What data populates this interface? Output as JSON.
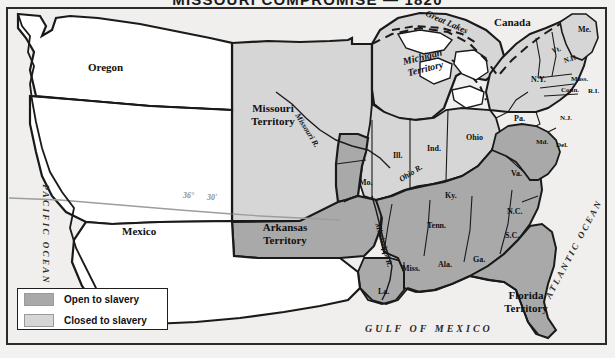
{
  "map": {
    "title": "MISSOURI COMPROMISE — 1820",
    "colors": {
      "open_to_slavery": "#a9a9a9",
      "closed_to_slavery": "#d6d6d6",
      "unorganized": "#ffffff",
      "ocean": "#f0efed",
      "border": "#1a1a1a",
      "latitude_line": "#9d9d9d"
    }
  },
  "legend": {
    "items": [
      {
        "label": "Open to slavery",
        "swatch": "#a9a9a9"
      },
      {
        "label": "Closed to slavery",
        "swatch": "#d6d6d6"
      }
    ]
  },
  "labels": {
    "oceans": [
      {
        "name": "pacific-ocean",
        "text": "PACIFIC OCEAN"
      },
      {
        "name": "atlantic-ocean",
        "text": "ATLANTIC OCEAN"
      },
      {
        "name": "gulf-of-mexico",
        "text": "GULF OF MEXICO"
      }
    ],
    "countries": [
      {
        "name": "canada",
        "text": "Canada"
      },
      {
        "name": "mexico",
        "text": "Mexico"
      }
    ],
    "regions": [
      {
        "name": "oregon",
        "text": "Oregon"
      }
    ],
    "territories": [
      {
        "name": "missouri-territory",
        "line1": "Missouri",
        "line2": "Territory"
      },
      {
        "name": "michigan-territory",
        "line1": "Michigan",
        "line2": "Territory"
      },
      {
        "name": "arkansas-territory",
        "line1": "Arkansas",
        "line2": "Territory"
      },
      {
        "name": "florida-territory",
        "line1": "Florida",
        "line2": "Territory"
      }
    ],
    "states": [
      {
        "name": "maine",
        "text": "Me."
      },
      {
        "name": "vermont",
        "text": "Vt."
      },
      {
        "name": "new-hampshire",
        "text": "N.H."
      },
      {
        "name": "massachusetts",
        "text": "Mass."
      },
      {
        "name": "connecticut",
        "text": "Conn."
      },
      {
        "name": "rhode-island",
        "text": "R.I."
      },
      {
        "name": "new-york",
        "text": "N.Y."
      },
      {
        "name": "pennsylvania",
        "text": "Pa."
      },
      {
        "name": "new-jersey",
        "text": "N.J."
      },
      {
        "name": "delaware",
        "text": "Del."
      },
      {
        "name": "maryland",
        "text": "Md."
      },
      {
        "name": "virginia",
        "text": "Va."
      },
      {
        "name": "north-carolina",
        "text": "N.C."
      },
      {
        "name": "south-carolina",
        "text": "S.C."
      },
      {
        "name": "georgia",
        "text": "Ga."
      },
      {
        "name": "alabama",
        "text": "Ala."
      },
      {
        "name": "mississippi",
        "text": "Miss."
      },
      {
        "name": "louisiana",
        "text": "La."
      },
      {
        "name": "tennessee",
        "text": "Tenn."
      },
      {
        "name": "kentucky",
        "text": "Ky."
      },
      {
        "name": "ohio",
        "text": "Ohio"
      },
      {
        "name": "indiana",
        "text": "Ind."
      },
      {
        "name": "illinois",
        "text": "Ill."
      },
      {
        "name": "missouri",
        "text": "Mo."
      }
    ],
    "water_features": [
      {
        "name": "great-lakes",
        "text": "Great Lakes"
      },
      {
        "name": "missouri-river",
        "text": "Missouri R."
      },
      {
        "name": "mississippi-river",
        "text": "Mississippi R."
      },
      {
        "name": "ohio-river",
        "text": "Ohio R."
      }
    ],
    "latitude": [
      {
        "name": "latitude-36-degrees",
        "text": "36°"
      },
      {
        "name": "latitude-30-minutes",
        "text": "30'"
      }
    ]
  }
}
